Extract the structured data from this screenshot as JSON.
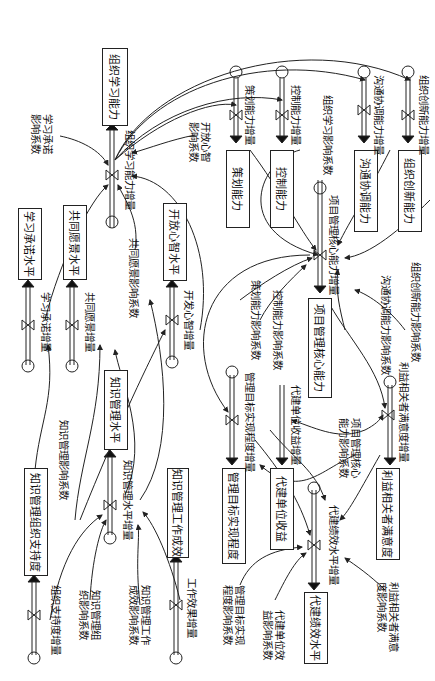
{
  "stocks": {
    "org_learning": "组织学习能力",
    "learning_commit_level": "学习承诺水平",
    "shared_vision_level": "共同愿景水平",
    "open_mind_level": "开放心智水平",
    "km_level": "知识管理水平",
    "km_org_support": "知识管理组织支持度",
    "km_work_effect": "知识管理工作成效",
    "planning": "策划能力",
    "control": "控制能力",
    "communication": "沟通协调能力",
    "innovation": "组织创新能力",
    "pm_core": "项目管理核心能力",
    "mgmt_goal": "管理目标实现程度",
    "agent_benefit": "代建单位收益",
    "stakeholder_sat": "利益相关者满意度",
    "agent_perf": "代建绩效水平"
  },
  "flows": {
    "org_learning_inc": "组织学习能力增量",
    "learning_commit_inc": "学习承诺增量",
    "shared_vision_inc": "共同愿景增量",
    "open_mind_inc": "开发心智增量",
    "km_level_inc": "知识管理水平增量",
    "org_support_inc": "组织支持度增量",
    "work_effect_inc": "工作效果增量",
    "planning_inc": "策划能力增量",
    "control_inc": "控制能力增量",
    "communication_inc": "沟通协调能力增量",
    "innovation_inc": "组织创新能力增量",
    "pm_core_inc": "项目管理核心能力增量",
    "mgmt_goal_inc": "管理目标实现程度增量",
    "agent_benefit_inc": "代建单位收益增量",
    "stakeholder_inc": "利益相关者满意度增量",
    "agent_perf_inc": "代建绩效水平增量"
  },
  "auxiliaries": {
    "learning_commit_coef": "学习承诺\n影响系数",
    "open_mind_coef": "开放心智\n影响系数",
    "shared_vision_coef": "共同愿景影响系数",
    "km_coef": "知识管理影响系数",
    "km_org_coef": "知识管理组\n织影响系数",
    "km_work_coef": "知识管理工作\n成效影响系数",
    "org_learning_coef": "组织学习影响系数",
    "planning_coef": "策划能力影响系数",
    "control_coef": "控制能力影响系数",
    "communication_coef": "沟通协调能力影响系数",
    "innovation_coef": "组织创新能力影响系数",
    "pm_core_coef": "项目管理核心\n能力影响系数",
    "mgmt_goal_coef": "管理目标实现\n程度影响系数",
    "agent_benefit_coef": "代建单位效\n益影响系数",
    "stakeholder_coef": "利益相关者满意\n度影响系数"
  }
}
